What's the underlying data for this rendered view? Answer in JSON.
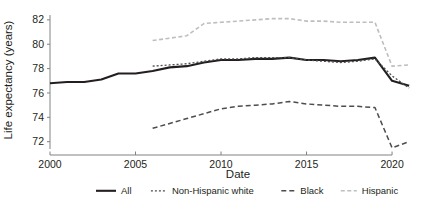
{
  "chart_data": {
    "type": "line",
    "title": "",
    "xlabel": "Date",
    "ylabel": "Life expectancy (years)",
    "xlim": [
      2000,
      2021.4
    ],
    "ylim": [
      71.4,
      82.4
    ],
    "xticks": [
      "2000",
      "2005",
      "2010",
      "2015",
      "2020"
    ],
    "xtick_values": [
      2000,
      2005,
      2010,
      2015,
      2020
    ],
    "yticks": [
      "72",
      "74",
      "76",
      "78",
      "80",
      "82"
    ],
    "ytick_values": [
      72,
      74,
      76,
      78,
      80,
      82
    ],
    "grid": false,
    "legend_position": "bottom",
    "series": [
      {
        "name": "All",
        "color": "#231f20",
        "dash": "none",
        "width": 2.1,
        "x": [
          2000,
          2001,
          2002,
          2003,
          2004,
          2005,
          2006,
          2007,
          2008,
          2009,
          2010,
          2011,
          2012,
          2013,
          2014,
          2015,
          2016,
          2017,
          2018,
          2019,
          2020,
          2021
        ],
        "values": [
          76.8,
          76.9,
          76.9,
          77.1,
          77.6,
          77.6,
          77.8,
          78.1,
          78.2,
          78.5,
          78.7,
          78.7,
          78.8,
          78.8,
          78.9,
          78.7,
          78.7,
          78.6,
          78.7,
          78.9,
          77.0,
          76.6
        ]
      },
      {
        "name": "Non-Hispanic white",
        "color": "#4d4d4f",
        "dash": "2,2",
        "width": 1.3,
        "x": [
          2006,
          2007,
          2008,
          2009,
          2010,
          2011,
          2012,
          2013,
          2014,
          2015,
          2016,
          2017,
          2018,
          2019,
          2020,
          2021
        ],
        "values": [
          78.2,
          78.3,
          78.4,
          78.6,
          78.8,
          78.8,
          78.9,
          78.9,
          78.9,
          78.7,
          78.6,
          78.5,
          78.6,
          78.8,
          77.4,
          76.4
        ]
      },
      {
        "name": "Black",
        "color": "#4d4d4f",
        "dash": "5,3",
        "width": 1.5,
        "x": [
          2006,
          2007,
          2008,
          2009,
          2010,
          2011,
          2012,
          2013,
          2014,
          2015,
          2016,
          2017,
          2018,
          2019,
          2020,
          2021
        ],
        "values": [
          73.1,
          73.5,
          73.9,
          74.3,
          74.7,
          74.9,
          75.0,
          75.1,
          75.3,
          75.1,
          75.0,
          74.9,
          74.9,
          74.8,
          71.5,
          72.0
        ]
      },
      {
        "name": "Hispanic",
        "color": "#bcbec0",
        "dash": "4,2.5",
        "width": 1.6,
        "x": [
          2006,
          2007,
          2008,
          2009,
          2010,
          2011,
          2012,
          2013,
          2014,
          2015,
          2016,
          2017,
          2018,
          2019,
          2020,
          2021
        ],
        "values": [
          80.3,
          80.5,
          80.7,
          81.7,
          81.8,
          81.9,
          82.0,
          82.1,
          82.1,
          81.9,
          81.9,
          81.8,
          81.8,
          81.8,
          78.2,
          78.3
        ]
      }
    ]
  },
  "axes": {
    "y_label": "Life expectancy (years)",
    "x_label": "Date",
    "y_ticks": [
      "82",
      "80",
      "78",
      "76",
      "74",
      "72"
    ],
    "x_ticks": [
      "2000",
      "2005",
      "2010",
      "2015",
      "2020"
    ]
  },
  "legend": {
    "items": [
      {
        "label": "All",
        "swatch": "solid-line-swatch"
      },
      {
        "label": "Non-Hispanic white",
        "swatch": "fine-dashed-line-swatch"
      },
      {
        "label": "Black",
        "swatch": "dashed-line-swatch"
      },
      {
        "label": "Hispanic",
        "swatch": "light-dashed-line-swatch"
      }
    ]
  }
}
